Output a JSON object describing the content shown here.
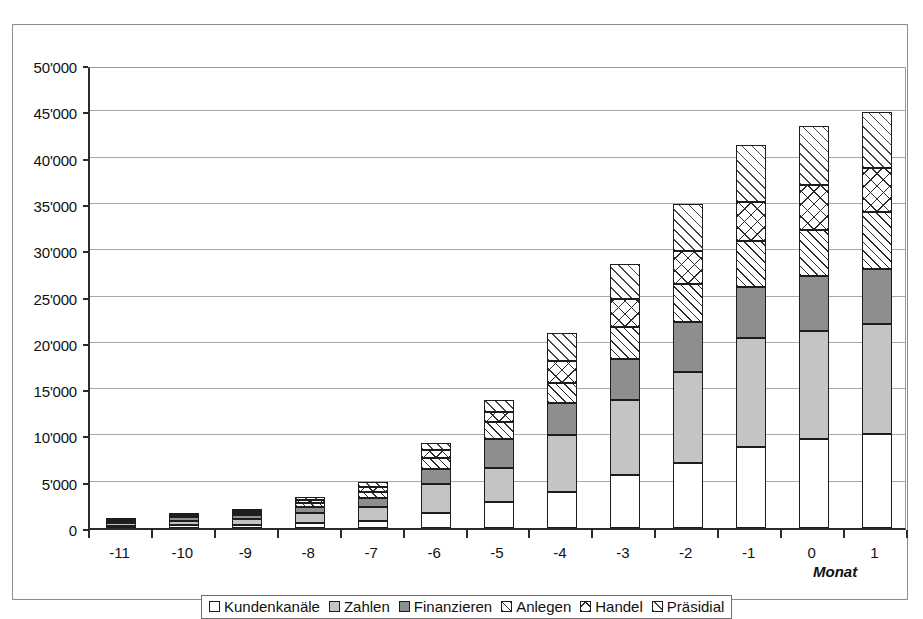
{
  "chart_data": {
    "type": "bar",
    "subtype": "stacked-column",
    "title": "",
    "xlabel": "Monat",
    "ylabel": "",
    "categories": [
      "-11",
      "-10",
      "-9",
      "-8",
      "-7",
      "-6",
      "-5",
      "-4",
      "-3",
      "-2",
      "-1",
      "0",
      "1"
    ],
    "ylim": [
      0,
      50000
    ],
    "ytick_values": [
      0,
      5000,
      10000,
      15000,
      20000,
      25000,
      30000,
      35000,
      40000,
      45000,
      50000
    ],
    "ytick_labels": [
      "0",
      "5'000",
      "10'000",
      "15'000",
      "20'000",
      "25'000",
      "30'000",
      "35'000",
      "40'000",
      "45'000",
      "50'000"
    ],
    "grid": true,
    "grid_axis": "y",
    "legend_position": "bottom",
    "series": [
      {
        "name": "Kundenkanäle",
        "fill": "white",
        "color": "#ffffff",
        "values": [
          200,
          300,
          350,
          500,
          800,
          1600,
          2800,
          3900,
          5700,
          7000,
          8800,
          9600,
          10100
        ]
      },
      {
        "name": "Zahlen",
        "fill": "light-gray",
        "color": "#c4c4c4",
        "values": [
          350,
          500,
          650,
          1100,
          1500,
          3200,
          3700,
          6100,
          8100,
          9900,
          11700,
          11700,
          11900
        ]
      },
      {
        "name": "Finanzieren",
        "fill": "dark-gray",
        "color": "#8e8e8e",
        "values": [
          150,
          350,
          400,
          700,
          900,
          1600,
          3100,
          3500,
          4400,
          5300,
          5500,
          5900,
          6000
        ]
      },
      {
        "name": "Anlegen",
        "fill": "diagonal-hatch",
        "color": "#ffffff",
        "values": [
          100,
          200,
          250,
          400,
          700,
          1200,
          1900,
          2200,
          3500,
          4200,
          5000,
          5000,
          6100
        ]
      },
      {
        "name": "Handel",
        "fill": "cross-hatch",
        "color": "#ffffff",
        "values": [
          60,
          80,
          150,
          300,
          500,
          800,
          1000,
          2300,
          3000,
          3500,
          4200,
          4800,
          4800
        ]
      },
      {
        "name": "Präsidial",
        "fill": "light-hatch",
        "color": "#ffffff",
        "values": [
          90,
          120,
          200,
          350,
          600,
          800,
          1300,
          3100,
          3800,
          5100,
          6200,
          6400,
          6000
        ]
      }
    ],
    "totals": [
      950,
      1550,
      2000,
      3350,
      5000,
      9200,
      13800,
      21100,
      28500,
      35000,
      41400,
      43400,
      44900
    ]
  },
  "legend": {
    "items": [
      {
        "label": "Kundenkanäle",
        "fill": "white"
      },
      {
        "label": "Zahlen",
        "fill": "light-gray"
      },
      {
        "label": "Finanzieren",
        "fill": "dark-gray"
      },
      {
        "label": "Anlegen",
        "fill": "diagonal-hatch"
      },
      {
        "label": "Handel",
        "fill": "cross-hatch"
      },
      {
        "label": "Präsidial",
        "fill": "light-hatch"
      }
    ]
  },
  "axis": {
    "x_title": "Monat"
  }
}
